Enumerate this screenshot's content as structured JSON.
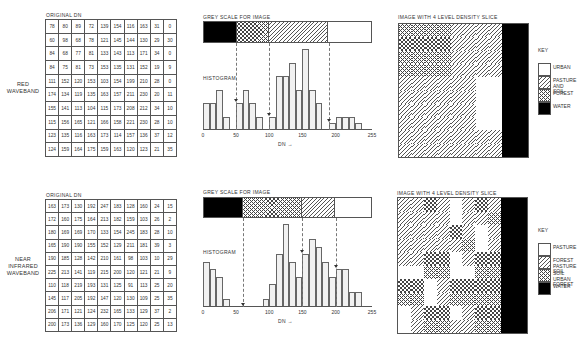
{
  "panels": [
    {
      "id": "red",
      "side_label": "RED\nWAVEBAND",
      "table_title": "ORIGINAL  DN",
      "grid": [
        [
          78,
          80,
          89,
          72,
          139,
          154,
          116,
          163,
          31,
          0
        ],
        [
          60,
          98,
          68,
          78,
          121,
          145,
          144,
          130,
          29,
          30
        ],
        [
          84,
          68,
          77,
          81,
          133,
          143,
          113,
          171,
          34,
          0
        ],
        [
          84,
          75,
          81,
          73,
          153,
          135,
          131,
          152,
          19,
          9
        ],
        [
          111,
          152,
          120,
          153,
          103,
          154,
          199,
          210,
          28,
          0
        ],
        [
          174,
          134,
          119,
          135,
          163,
          157,
          211,
          230,
          20,
          11
        ],
        [
          155,
          141,
          113,
          104,
          115,
          173,
          208,
          212,
          34,
          10
        ],
        [
          115,
          156,
          165,
          121,
          166,
          158,
          221,
          230,
          28,
          10
        ],
        [
          123,
          135,
          116,
          163,
          173,
          114,
          157,
          136,
          37,
          12
        ],
        [
          124,
          159,
          164,
          175,
          159,
          163,
          120,
          123,
          21,
          35
        ]
      ],
      "grey_scale_title": "GREY SCALE FOR IMAGE",
      "grey_scale": [
        {
          "from": 0,
          "to": 50,
          "pattern": "water"
        },
        {
          "from": 50,
          "to": 100,
          "pattern": "cross"
        },
        {
          "from": 100,
          "to": 190,
          "pattern": "hatch"
        },
        {
          "from": 190,
          "to": 255,
          "pattern": "white"
        }
      ],
      "histogram_label": "HISTOGRAM",
      "xlabel": "DN →",
      "ticks": [
        0,
        50,
        100,
        150,
        200,
        255
      ],
      "map_title": "IMAGE  WITH  4  LEVEL  DENSITY  SLICE",
      "key_title": "KEY",
      "key": [
        {
          "label": "URBAN",
          "pattern": "white"
        },
        {
          "label": "PASTURE\nAND  SOIL",
          "pattern": "hatch"
        },
        {
          "label": "FOREST",
          "pattern": "cross"
        },
        {
          "label": "WATER",
          "pattern": "water"
        }
      ]
    },
    {
      "id": "nir",
      "side_label": "NEAR\nINFRARED\nWAVEBAND",
      "table_title": "ORIGINAL  DN",
      "grid": [
        [
          163,
          173,
          130,
          192,
          247,
          183,
          128,
          160,
          24,
          15
        ],
        [
          172,
          160,
          175,
          164,
          213,
          182,
          159,
          103,
          26,
          2
        ],
        [
          180,
          169,
          169,
          170,
          133,
          154,
          245,
          183,
          28,
          10
        ],
        [
          165,
          190,
          190,
          155,
          152,
          129,
          211,
          181,
          39,
          3
        ],
        [
          190,
          185,
          128,
          142,
          210,
          161,
          98,
          103,
          10,
          29
        ],
        [
          225,
          213,
          141,
          119,
          215,
          200,
          120,
          121,
          21,
          9
        ],
        [
          110,
          118,
          219,
          193,
          131,
          125,
          91,
          113,
          25,
          20
        ],
        [
          145,
          117,
          205,
          192,
          147,
          120,
          130,
          109,
          25,
          35
        ],
        [
          206,
          171,
          121,
          124,
          232,
          165,
          133,
          129,
          37,
          2
        ],
        [
          200,
          173,
          136,
          129,
          160,
          170,
          125,
          120,
          25,
          13
        ]
      ],
      "grey_scale_title": "GREY SCALE FOR IMAGE",
      "grey_scale": [
        {
          "from": 0,
          "to": 60,
          "pattern": "water"
        },
        {
          "from": 60,
          "to": 150,
          "pattern": "cross"
        },
        {
          "from": 150,
          "to": 200,
          "pattern": "hatch"
        },
        {
          "from": 200,
          "to": 255,
          "pattern": "white"
        }
      ],
      "histogram_label": "HISTOGRAM",
      "xlabel": "DN →",
      "ticks": [
        0,
        50,
        100,
        150,
        200,
        255
      ],
      "map_title": "IMAGE  WITH  4  LEVEL  DENSITY  SLICE",
      "key_title": "KEY",
      "key": [
        {
          "label": "PASTURE",
          "pattern": "white"
        },
        {
          "label": "FOREST\nPASTURE\nSOIL",
          "pattern": "hatch"
        },
        {
          "label": "SOIL\nURBAN\nFOREST",
          "pattern": "cross"
        },
        {
          "label": "WATER",
          "pattern": "water"
        }
      ]
    }
  ],
  "chart_data": [
    {
      "type": "bar",
      "title": "HISTOGRAM (Red waveband)",
      "xlabel": "DN",
      "ylabel": "",
      "xlim": [
        0,
        255
      ],
      "bin_width": 10,
      "bins_start": [
        0,
        10,
        20,
        30,
        50,
        60,
        70,
        80,
        100,
        110,
        120,
        130,
        140,
        150,
        160,
        170,
        190,
        200,
        210,
        220,
        230
      ],
      "values": [
        4,
        4,
        6,
        2,
        4,
        6,
        4,
        2,
        2,
        8,
        8,
        10,
        6,
        12,
        6,
        4,
        1,
        2,
        2,
        2,
        1
      ],
      "thresholds": [
        50,
        100,
        190
      ]
    },
    {
      "type": "bar",
      "title": "HISTOGRAM (Near infrared waveband)",
      "xlabel": "DN",
      "ylabel": "",
      "xlim": [
        0,
        255
      ],
      "bin_width": 10,
      "bins_start": [
        0,
        10,
        20,
        30,
        90,
        100,
        110,
        120,
        130,
        140,
        150,
        160,
        170,
        180,
        190,
        200,
        210,
        220,
        230
      ],
      "values": [
        6,
        5,
        4,
        1,
        1,
        3,
        7,
        11,
        6,
        4,
        7,
        9,
        8,
        6,
        4,
        5,
        5,
        2,
        2
      ],
      "thresholds": [
        60,
        150,
        200
      ]
    }
  ]
}
